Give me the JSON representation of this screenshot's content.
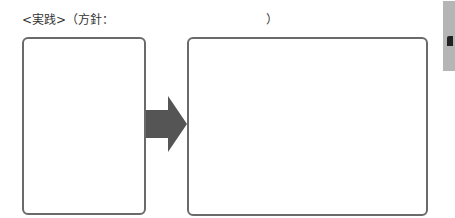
{
  "worksheet": {
    "heading": "<実践>（方針：",
    "heading_close": "）",
    "left_box": {
      "text": ""
    },
    "right_box": {
      "text": ""
    },
    "arrow": {
      "icon": "right-arrow-icon",
      "color": "#555555"
    },
    "side_tab": {
      "color": "#b5b5b5"
    }
  }
}
